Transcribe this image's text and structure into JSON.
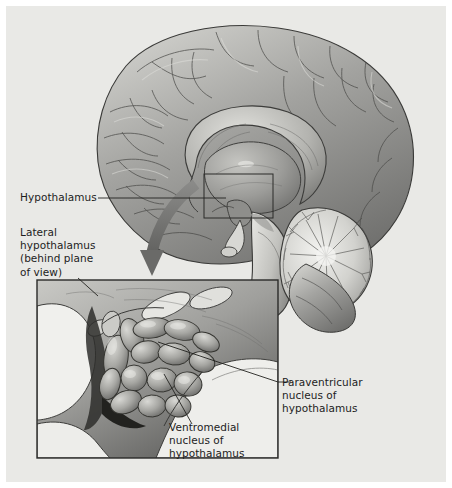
{
  "figure": {
    "type": "anatomical-illustration",
    "style": "grayscale medical illustration",
    "background_color": "#e9e9e6",
    "ink_color": "#1d1d1d",
    "arrow_color": "#6e6e6e"
  },
  "labels": {
    "hypothalamus": "Hypothalamus",
    "lateral_hypothalamus": "Lateral\nhypothalamus\n(behind plane\nof view)",
    "paraventricular": "Paraventricular\nnucleus of\nhypothalamus",
    "ventromedial": "Ventromedial\nnucleus of\nhypothalamus"
  },
  "structures": {
    "cerebrum": "cerebral-cortex",
    "corpus_callosum": "corpus-callosum",
    "thalamus": "thalamus",
    "hypothalamus": "hypothalamus",
    "pituitary": "pituitary-stalk",
    "brainstem": "brainstem",
    "cerebellum": "cerebellum-arbor-vitae"
  },
  "callout": {
    "selection_box": "hypothalamus-region-selection",
    "arrow": "magnify-arrow",
    "inset_box": "hypothalamus-detail-inset"
  }
}
